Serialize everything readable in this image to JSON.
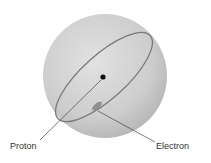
{
  "diagram": {
    "labels": {
      "proton": "Proton",
      "electron": "Electron"
    },
    "colors": {
      "sphere_light": "#e4e4e4",
      "sphere_dark": "#b4b4b4",
      "orbit": "#7a7a7a",
      "proton": "#111111",
      "leader": "#444444"
    }
  }
}
